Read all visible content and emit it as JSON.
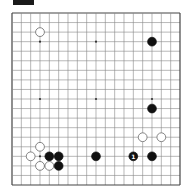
{
  "diagram": {
    "label_box": {
      "color": "#1a1a1a"
    },
    "board": {
      "size": 19,
      "origin": {
        "x": 12,
        "y": 13
      },
      "spacing": {
        "x": 9.333,
        "y": 9.556
      },
      "line_color": "#888888",
      "border_color": "#444444",
      "background": "#ffffff",
      "stone_radius": 4.4
    },
    "star_points": [
      [
        3,
        3
      ],
      [
        9,
        3
      ],
      [
        15,
        3
      ],
      [
        3,
        9
      ],
      [
        9,
        9
      ],
      [
        15,
        9
      ],
      [
        3,
        15
      ],
      [
        9,
        15
      ],
      [
        15,
        15
      ]
    ],
    "stones": [
      {
        "color": "white",
        "col": 3,
        "row": 2,
        "label": ""
      },
      {
        "color": "black",
        "col": 15,
        "row": 3,
        "label": ""
      },
      {
        "color": "black",
        "col": 15,
        "row": 10,
        "label": ""
      },
      {
        "color": "white",
        "col": 14,
        "row": 13,
        "label": ""
      },
      {
        "color": "white",
        "col": 16,
        "row": 13,
        "label": ""
      },
      {
        "color": "white",
        "col": 3,
        "row": 14,
        "label": ""
      },
      {
        "color": "white",
        "col": 2,
        "row": 15,
        "label": ""
      },
      {
        "color": "black",
        "col": 4,
        "row": 15,
        "label": ""
      },
      {
        "color": "black",
        "col": 5,
        "row": 15,
        "label": ""
      },
      {
        "color": "black",
        "col": 9,
        "row": 15,
        "label": ""
      },
      {
        "color": "black",
        "col": 13,
        "row": 15,
        "label": "1"
      },
      {
        "color": "black",
        "col": 15,
        "row": 15,
        "label": ""
      },
      {
        "color": "white",
        "col": 3,
        "row": 16,
        "label": ""
      },
      {
        "color": "white",
        "col": 4,
        "row": 16,
        "label": ""
      },
      {
        "color": "black",
        "col": 5,
        "row": 16,
        "label": ""
      }
    ]
  }
}
